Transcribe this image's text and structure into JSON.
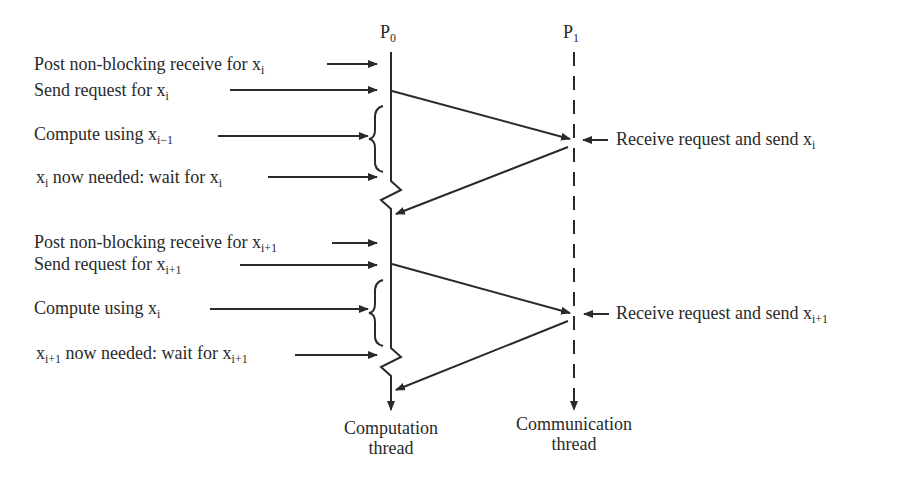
{
  "processes": {
    "p0": {
      "base": "P",
      "sub": "0"
    },
    "p1": {
      "base": "P",
      "sub": "1"
    }
  },
  "left_labels": [
    {
      "text": "Post non-blocking receive for x",
      "sub": "i",
      "suffix": ""
    },
    {
      "text": "Send request for x",
      "sub": "i",
      "suffix": ""
    },
    {
      "text": "Compute using x",
      "sub": "i−1",
      "suffix": ""
    },
    {
      "prefix": "x",
      "prefix_sub": "i",
      "text": " now needed: wait for x",
      "sub": "i"
    },
    {
      "text": "Post non-blocking receive for x",
      "sub": "i+1",
      "suffix": ""
    },
    {
      "text": "Send request for x",
      "sub": "i+1",
      "suffix": ""
    },
    {
      "text": "Compute using x",
      "sub": "i",
      "suffix": ""
    },
    {
      "prefix": "x",
      "prefix_sub": "i+1",
      "text": " now needed: wait for x",
      "sub": "i+1"
    }
  ],
  "right_labels": [
    {
      "text": "Receive request and send x",
      "sub": "i"
    },
    {
      "text": "Receive request and send x",
      "sub": "i+1"
    }
  ],
  "bottom_labels": {
    "computation": [
      "Computation",
      "thread"
    ],
    "communication": [
      "Communication",
      "thread"
    ]
  }
}
